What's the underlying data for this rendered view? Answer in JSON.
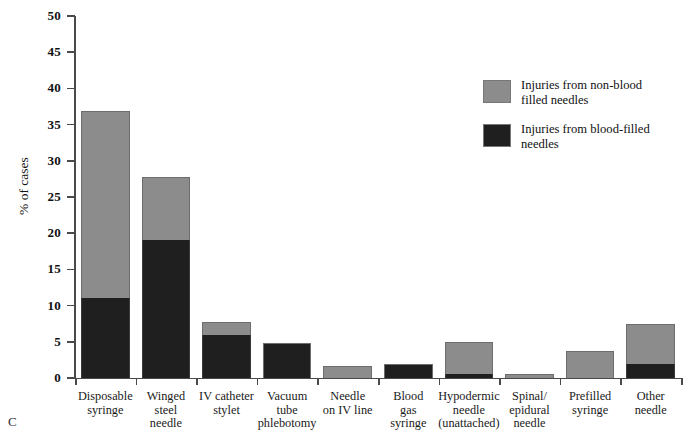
{
  "panel_letter": "C",
  "legend": {
    "position": "top-right",
    "items": [
      {
        "label_lines": [
          "Injuries from non-blood",
          "filled needles"
        ],
        "color": "#8c8c8c",
        "series": "non_blood_filled"
      },
      {
        "label_lines": [
          "Injuries from blood-filled",
          "needles"
        ],
        "color": "#1f1f1f",
        "series": "blood_filled"
      }
    ]
  },
  "axes": {
    "y_title": "% of cases",
    "y_ticks": [
      "0",
      "5",
      "10",
      "15",
      "20",
      "25",
      "30",
      "35",
      "40",
      "45",
      "50"
    ]
  },
  "chart_data": {
    "type": "bar",
    "stacked": true,
    "title": "",
    "xlabel": "",
    "ylabel": "% of cases",
    "ylim": [
      0,
      50
    ],
    "ytick_step": 5,
    "grid": false,
    "legend_position": "top-right",
    "categories": [
      "Disposable syringe",
      "Winged steel needle",
      "IV catheter stylet",
      "Vacuum tube phlebotomy",
      "Needle on IV line",
      "Blood gas syringe",
      "Hypodermic needle (unattached)",
      "Spinal/epidural needle",
      "Prefilled syringe",
      "Other needle"
    ],
    "category_label_lines": [
      [
        "Disposable",
        "syringe"
      ],
      [
        "Winged",
        "steel",
        "needle"
      ],
      [
        "IV  catheter",
        "stylet"
      ],
      [
        "Vacuum",
        "tube",
        "phlebotomy"
      ],
      [
        "Needle",
        "on IV line"
      ],
      [
        "Blood",
        "gas",
        "syringe"
      ],
      [
        "Hypodermic",
        "needle",
        "(unattached)"
      ],
      [
        "Spinal/",
        "epidural",
        "needle"
      ],
      [
        "Prefilled",
        "syringe"
      ],
      [
        "Other",
        "needle"
      ]
    ],
    "series": [
      {
        "name": "Injuries from blood-filled needles",
        "color": "#1f1f1f",
        "values": [
          11.0,
          19.1,
          5.9,
          4.9,
          0.0,
          2.0,
          0.5,
          0.0,
          0.0,
          2.0
        ]
      },
      {
        "name": "Injuries from non-blood filled needles",
        "color": "#8c8c8c",
        "values": [
          25.9,
          8.6,
          1.8,
          0.0,
          1.6,
          0.0,
          4.5,
          0.6,
          3.7,
          5.4
        ]
      }
    ],
    "totals": [
      36.9,
      27.7,
      7.7,
      4.9,
      1.6,
      2.0,
      5.0,
      0.6,
      3.7,
      7.4
    ]
  }
}
